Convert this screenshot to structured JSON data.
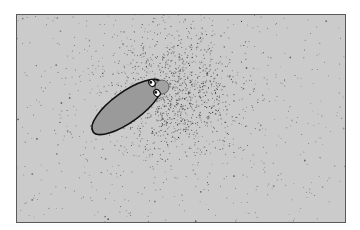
{
  "illustration": {
    "subject": "cartoon bacterium emitting particle cloud",
    "frame": {
      "x": 16,
      "y": 14,
      "width": 330,
      "height": 209,
      "background": "#cbcbcb",
      "border": "#5a5a5a"
    },
    "creature": {
      "body_fill": "#9a9a9a",
      "outline": "#111111",
      "center": [
        126,
        106
      ],
      "length": 84,
      "thickness": 30,
      "rotation_deg": -36,
      "head": {
        "cx": 161,
        "cy": 86,
        "r": 7,
        "fill": "#a2a2a2"
      },
      "eyes": [
        {
          "cx": 151,
          "cy": 82
        },
        {
          "cx": 156,
          "cy": 92
        }
      ]
    },
    "particle_cloud": {
      "center": [
        172,
        92
      ],
      "dense_radius": 34,
      "sparse_radius": 130,
      "dense_count": 900,
      "sparse_count": 420,
      "color": "#2a2a2a"
    }
  }
}
